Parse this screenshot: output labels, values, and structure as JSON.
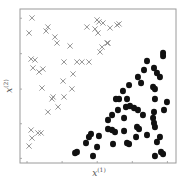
{
  "chart_data": {
    "type": "scatter",
    "title": "",
    "xlabel": "x(1)",
    "ylabel": "x(2)",
    "xlim": [
      0,
      100
    ],
    "ylim": [
      0,
      100
    ],
    "grid": false,
    "legend": null,
    "tick_labels_shown": false,
    "x_ticks": [
      4.5,
      27,
      49.5,
      72,
      94.5
    ],
    "y_ticks": [
      3,
      25.5,
      48,
      71,
      94
    ],
    "series": [
      {
        "name": "class-cross",
        "marker": "x",
        "color": "#8a8a8a",
        "points": [
          [
            7.7,
            94.2
          ],
          [
            5.8,
            84.4
          ],
          [
            17.9,
            88.3
          ],
          [
            16.7,
            85.7
          ],
          [
            22.4,
            81.8
          ],
          [
            23.7,
            77.9
          ],
          [
            32.1,
            76
          ],
          [
            42.9,
            88.3
          ],
          [
            49.4,
            92.9
          ],
          [
            50.6,
            91.6
          ],
          [
            53.2,
            90.9
          ],
          [
            48.1,
            87
          ],
          [
            50,
            84.4
          ],
          [
            57.7,
            87.7
          ],
          [
            62.2,
            89.6
          ],
          [
            63.5,
            90.3
          ],
          [
            55.8,
            77.9
          ],
          [
            56.4,
            77.9
          ],
          [
            52.6,
            75.3
          ],
          [
            51.3,
            72.1
          ],
          [
            7.1,
            67.5
          ],
          [
            9.6,
            66.9
          ],
          [
            8.3,
            61.7
          ],
          [
            12.2,
            59.1
          ],
          [
            14.7,
            61
          ],
          [
            28.2,
            65.6
          ],
          [
            36.5,
            65.6
          ],
          [
            39.7,
            65.6
          ],
          [
            44.2,
            65.6
          ],
          [
            34,
            57.8
          ],
          [
            27.6,
            53.2
          ],
          [
            33.3,
            48.1
          ],
          [
            14.1,
            48.7
          ],
          [
            21.2,
            42.9
          ],
          [
            20.5,
            41.6
          ],
          [
            28.2,
            42.9
          ],
          [
            24.4,
            36.4
          ],
          [
            17.9,
            33.1
          ],
          [
            7.1,
            21.4
          ],
          [
            7.7,
            16.2
          ],
          [
            11.5,
            19.5
          ],
          [
            13.5,
            19.5
          ],
          [
            5.8,
            11
          ]
        ]
      },
      {
        "name": "class-dot",
        "marker": "o",
        "color": "#111111",
        "points": [
          [
            91.7,
            71.4
          ],
          [
            91.7,
            69.5
          ],
          [
            81.4,
            66.2
          ],
          [
            79.5,
            60.4
          ],
          [
            85.9,
            61.7
          ],
          [
            87.8,
            58.4
          ],
          [
            89.7,
            55.8
          ],
          [
            75.6,
            55.8
          ],
          [
            77.6,
            51.9
          ],
          [
            69.9,
            50.6
          ],
          [
            85.3,
            49.4
          ],
          [
            86.5,
            48.1
          ],
          [
            66,
            46.8
          ],
          [
            63.5,
            41.6
          ],
          [
            61.5,
            41.6
          ],
          [
            68.6,
            41.6
          ],
          [
            86.5,
            41.6
          ],
          [
            94.2,
            39.6
          ],
          [
            70.5,
            37
          ],
          [
            67.9,
            36.4
          ],
          [
            73.1,
            35.7
          ],
          [
            75.6,
            34.4
          ],
          [
            62.8,
            34.4
          ],
          [
            59,
            31.2
          ],
          [
            78.8,
            31.2
          ],
          [
            85.9,
            33.1
          ],
          [
            92.3,
            34.4
          ],
          [
            56.4,
            27.9
          ],
          [
            66.7,
            29.2
          ],
          [
            85.3,
            29.2
          ],
          [
            85.9,
            26
          ],
          [
            86.5,
            23.4
          ],
          [
            56.4,
            22.1
          ],
          [
            59,
            21.4
          ],
          [
            75,
            23.4
          ],
          [
            76.3,
            22.1
          ],
          [
            66.7,
            20.8
          ],
          [
            81.4,
            18.2
          ],
          [
            74.4,
            16.9
          ],
          [
            45.5,
            18.8
          ],
          [
            44.2,
            16.9
          ],
          [
            50.6,
            17.5
          ],
          [
            60.9,
            20.1
          ],
          [
            89.7,
            16.9
          ],
          [
            87.8,
            13.6
          ],
          [
            42.3,
            13
          ],
          [
            49.4,
            10.4
          ],
          [
            59.6,
            12.3
          ],
          [
            68.6,
            13
          ],
          [
            69.9,
            12.3
          ],
          [
            35.3,
            6.5
          ],
          [
            36.5,
            7.1
          ],
          [
            46.8,
            4.5
          ],
          [
            86.5,
            4.5
          ],
          [
            90.4,
            7.1
          ],
          [
            91.7,
            5.8
          ]
        ]
      }
    ]
  },
  "labels": {
    "xlabel_base": "x",
    "xlabel_sup": "(1)",
    "ylabel_base": "x",
    "ylabel_sup": "(2)"
  }
}
